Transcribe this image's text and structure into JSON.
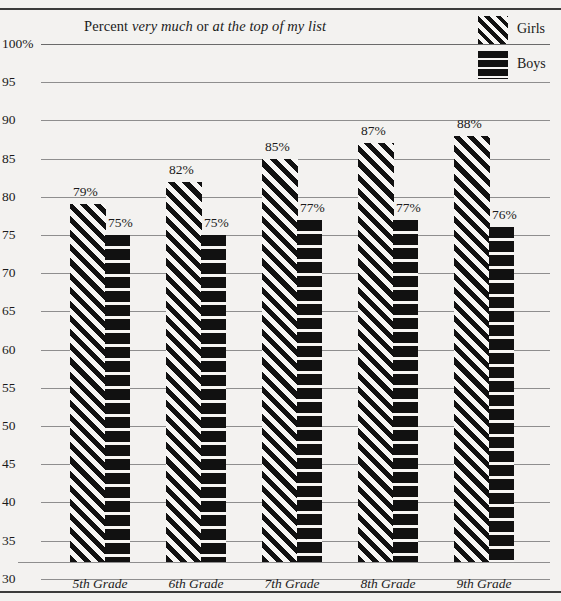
{
  "chart_data": {
    "type": "bar",
    "title": "Percent very much or at the top of my list",
    "title_parts": [
      {
        "text": "Percent ",
        "italic": false
      },
      {
        "text": "very much",
        "italic": true
      },
      {
        "text": " or ",
        "italic": false
      },
      {
        "text": "at the top of my list",
        "italic": true
      }
    ],
    "categories": [
      "5th Grade",
      "6th Grade",
      "7th Grade",
      "8th Grade",
      "9th Grade"
    ],
    "series": [
      {
        "name": "Girls",
        "values": [
          79,
          82,
          85,
          87,
          88
        ],
        "labels": [
          "79%",
          "82%",
          "85%",
          "87%",
          "88%"
        ],
        "pattern": "diagonal-stripes"
      },
      {
        "name": "Boys",
        "values": [
          75,
          75,
          77,
          77,
          76
        ],
        "labels": [
          "75%",
          "75%",
          "77%",
          "77%",
          "76%"
        ],
        "pattern": "horizontal-bands"
      }
    ],
    "xlabel": "",
    "ylabel": "",
    "ylim": [
      27,
      100
    ],
    "yticks": [
      100,
      95,
      90,
      85,
      80,
      75,
      70,
      65,
      60,
      55,
      50,
      45,
      40,
      35,
      30
    ],
    "ytick_labels": [
      "100%",
      "95",
      "90",
      "85",
      "80",
      "75",
      "70",
      "65",
      "60",
      "55",
      "50",
      "45",
      "40",
      "35",
      "30"
    ],
    "grid": true,
    "legend_position": "top-right",
    "colors": {
      "ink": "#111111",
      "background": "#f3f2f0",
      "gridline": "#8e8e8e",
      "rule": "#3b3b3b"
    }
  },
  "legend": {
    "items": [
      {
        "label": "Girls",
        "swatch": "diagonal-stripes-swatch"
      },
      {
        "label": "Boys",
        "swatch": "horizontal-bands-swatch"
      }
    ]
  }
}
